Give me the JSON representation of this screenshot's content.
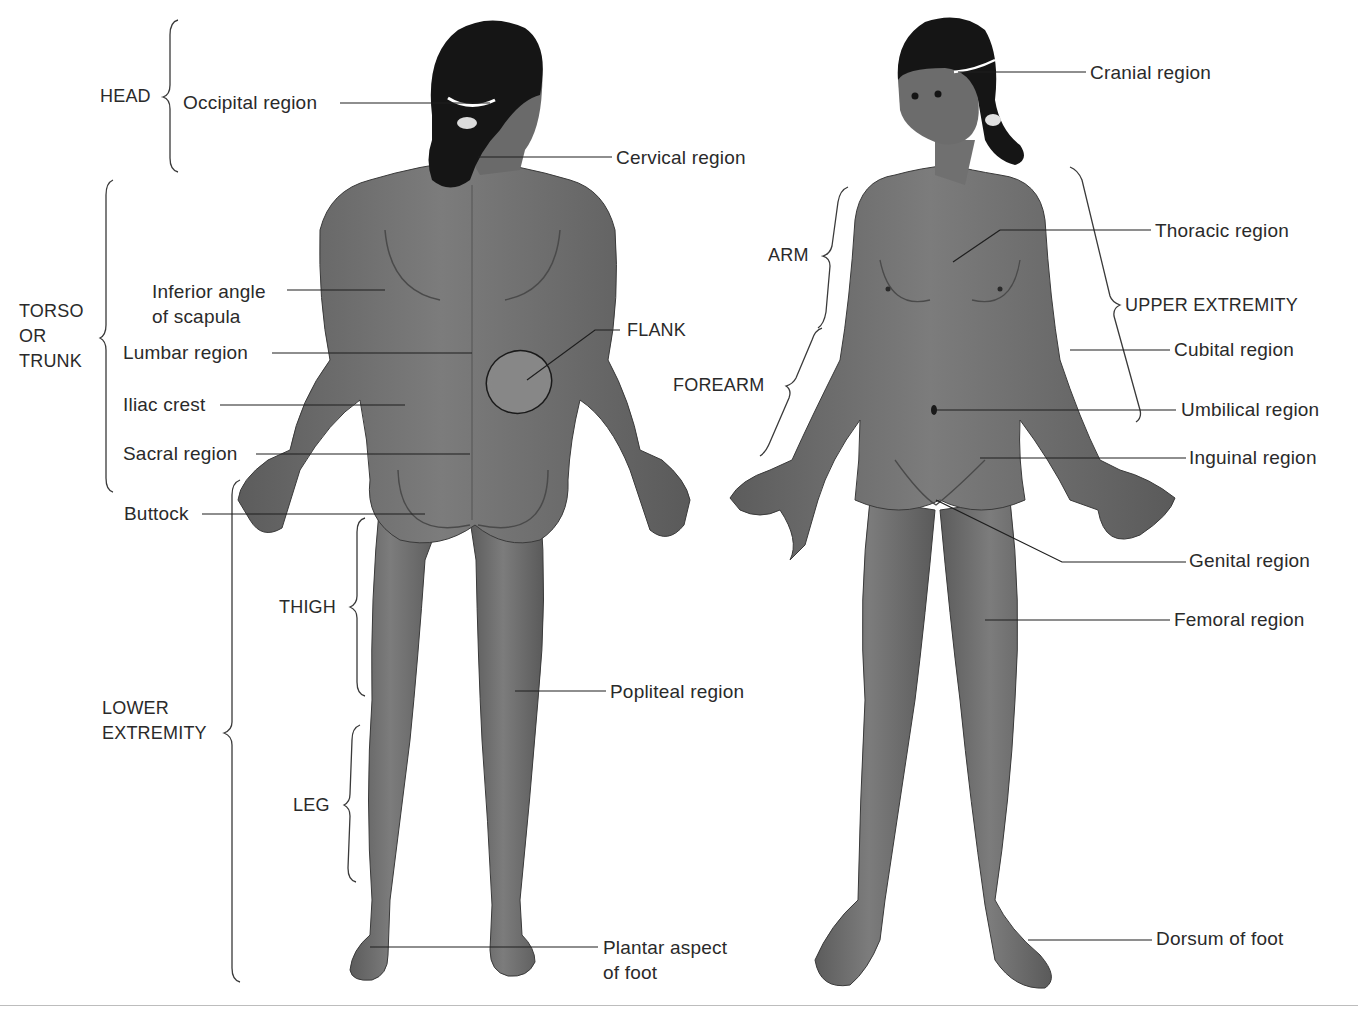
{
  "figure": {
    "views": [
      {
        "id": "posterior",
        "name": "Posterior view (back)"
      },
      {
        "id": "anterior",
        "name": "Anterior view (front)"
      }
    ],
    "colors": {
      "skin": "#6e6e6e",
      "skin_light": "#8a8a8a",
      "hair": "#151515",
      "line": "#1e1e1e",
      "text": "#2a2a2a",
      "background": "#ffffff"
    }
  },
  "groups": {
    "head": "HEAD",
    "torso": "TORSO\nOR\nTRUNK",
    "lower_extremity": "LOWER\nEXTREMITY",
    "thigh": "THIGH",
    "leg": "LEG",
    "arm": "ARM",
    "forearm": "FOREARM",
    "upper_extremity": "UPPER EXTREMITY",
    "flank": "FLANK"
  },
  "posterior_labels": {
    "occipital": "Occipital region",
    "cervical": "Cervical region",
    "inferior_angle": "Inferior angle\nof scapula",
    "lumbar": "Lumbar region",
    "iliac": "Iliac crest",
    "sacral": "Sacral region",
    "buttock": "Buttock",
    "popliteal": "Popliteal region",
    "plantar": "Plantar aspect\nof foot"
  },
  "anterior_labels": {
    "cranial": "Cranial region",
    "thoracic": "Thoracic region",
    "cubital": "Cubital region",
    "umbilical": "Umbilical region",
    "inguinal": "Inguinal region",
    "genital": "Genital region",
    "femoral": "Femoral region",
    "dorsum": "Dorsum of foot"
  }
}
